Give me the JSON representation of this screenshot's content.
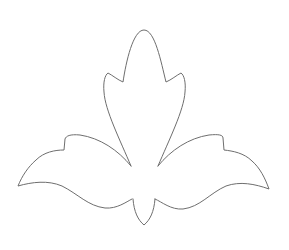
{
  "image": {
    "title": "Lotus / fleur outline",
    "background": "#ffffff",
    "stroke_color": "#6e6e6e",
    "width": 289,
    "height": 250
  },
  "shapes": {
    "center_petal": "M131,166 C120,140 105,110 104,92 C103,82 105,75 108,73 C112,75 118,80 123,82 C126,62 133,30 144,30 C155,30 161,62 166,82 C171,80 177,75 181,73 C184,75 186,82 185,92 C184,110 169,140 158,166",
    "left_wing": "M131,166 C118,150 100,138 80,135 C70,134 66,136 65,139 L64,150 C55,150 44,152 36,160 C28,167 22,176 18,186 C32,182 48,180 62,186 C78,194 88,206 105,208 C117,209 126,202 132,199",
    "right_wing": "M158,166 C171,150 189,138 209,135 C219,134 223,135 223,138 L224,150 C233,151 244,153 252,161 C260,168 265,178 269,189 C255,184 240,181 226,186 C210,193 200,207 183,209 C171,210 162,202 155,199",
    "bottom_petal": "M133,199 C134,212 138,220 144,225 C150,220 154,212 155,199"
  }
}
